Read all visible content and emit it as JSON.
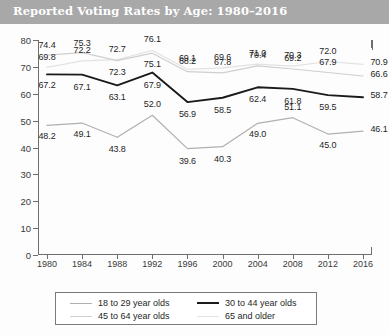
{
  "banner": {
    "title": "Reported Voting Rates by Age: 1980–2016",
    "background_color": "#a8a8a8",
    "text_color": "#ffffff"
  },
  "chart_data": {
    "type": "line",
    "title": "Reported Voting Rates by Age: 1980–2016",
    "xlabel": "",
    "ylabel": "",
    "xlim": [
      1980,
      2016
    ],
    "ylim": [
      0,
      80
    ],
    "grid": false,
    "legend_position": "bottom",
    "x": [
      1980,
      1984,
      1988,
      1992,
      1996,
      2000,
      2004,
      2008,
      2012,
      2016
    ],
    "categories": [
      "1980",
      "1984",
      "1988",
      "1992",
      "1996",
      "2000",
      "2004",
      "2008",
      "2012",
      "2016"
    ],
    "yticks": [
      0,
      10,
      20,
      30,
      40,
      50,
      60,
      70,
      80
    ],
    "series": [
      {
        "name": "18 to 29 year olds",
        "color": "#b0b0b0",
        "values": [
          48.2,
          49.1,
          43.8,
          52.0,
          39.6,
          40.3,
          49.0,
          51.1,
          45.0,
          46.1
        ]
      },
      {
        "name": "30 to 44 year olds",
        "color": "#1a1a1a",
        "values": [
          67.2,
          67.1,
          63.1,
          67.9,
          56.9,
          58.5,
          62.4,
          61.8,
          59.5,
          58.7
        ]
      },
      {
        "name": "45 to 64 year olds",
        "color": "#cfcfcf",
        "values": [
          74.4,
          75.3,
          72.3,
          75.1,
          68.2,
          67.8,
          70.4,
          69.2,
          67.9,
          66.6
        ]
      },
      {
        "name": "65 and older",
        "color": "#e2e2e2",
        "values": [
          69.8,
          72.2,
          72.7,
          76.1,
          69.1,
          69.6,
          71.0,
          70.3,
          72.0,
          70.9
        ]
      }
    ]
  },
  "legend": {
    "items": [
      {
        "label": "18 to 29 year olds",
        "color": "#b0b0b0"
      },
      {
        "label": "30 to 44 year olds",
        "color": "#1a1a1a"
      },
      {
        "label": "45 to 64 year olds",
        "color": "#cfcfcf"
      },
      {
        "label": "65 and older",
        "color": "#e2e2e2"
      }
    ]
  }
}
